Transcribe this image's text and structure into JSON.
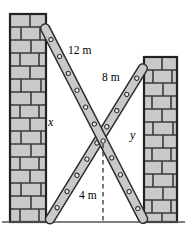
{
  "figure": {
    "labels": [
      {
        "name": "ladder-length-left",
        "text": "12 m",
        "x": 68,
        "y": 49,
        "style": "upright"
      },
      {
        "name": "ladder-length-right",
        "text": "8 m",
        "x": 102,
        "y": 76,
        "style": "upright"
      },
      {
        "name": "height-left-wall",
        "text": "x",
        "x": 48,
        "y": 121,
        "style": "italic"
      },
      {
        "name": "height-right-wall",
        "text": "y",
        "x": 130,
        "y": 134,
        "style": "italic"
      },
      {
        "name": "crossing-height",
        "text": "4 m",
        "x": 79,
        "y": 194,
        "style": "upright"
      }
    ],
    "colors": {
      "brick_fill": "#c9c9c9",
      "brick_stroke": "#3a3a3a",
      "wall_outline": "#222222",
      "ladder_fill": "#c9c9c9",
      "ladder_stroke": "#2b2b2b",
      "rung_fill": "#e8e8e8",
      "rung_stroke": "#2b2b2b",
      "ground_line": "#555555",
      "dashed_line": "#333333",
      "text": "#000000",
      "background": "#ffffff"
    },
    "geometry": {
      "ground_y": 222,
      "left_wall": {
        "x": 10,
        "y": 14,
        "width": 36,
        "height": 208,
        "brick_rows": 16
      },
      "right_wall": {
        "x": 144,
        "y": 57,
        "width": 33,
        "height": 165,
        "brick_rows": 13
      },
      "ladder_12m": {
        "top_x": 45,
        "top_y": 28,
        "foot_x": 143,
        "foot_y": 219,
        "rungs": 12,
        "width": 9
      },
      "ladder_8m": {
        "top_x": 143,
        "top_y": 68,
        "foot_x": 50,
        "foot_y": 219,
        "rungs": 9,
        "width": 9
      },
      "crossing_point": {
        "x": 95,
        "y": 140
      },
      "dashed_drop": {
        "x": 103,
        "y_top": 144,
        "y_bottom": 222
      }
    }
  }
}
